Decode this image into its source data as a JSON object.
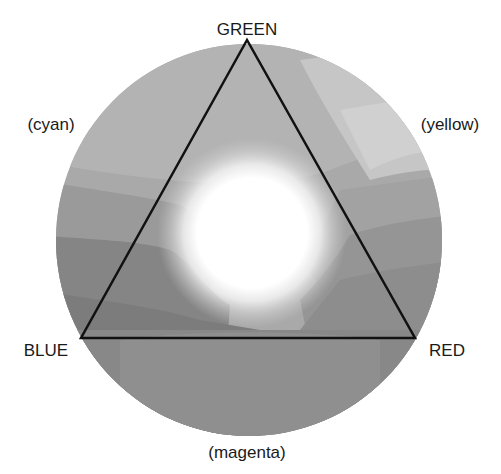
{
  "diagram": {
    "vertices": {
      "top": "GREEN",
      "left": "BLUE",
      "right": "RED"
    },
    "complements": {
      "upper_left": "(cyan)",
      "upper_right": "(yellow)",
      "bottom": "(magenta)"
    },
    "colors": {
      "background": "#ffffff",
      "triangle_stroke": "#111111",
      "center_glow": "#ffffff",
      "text": "#1a1a1a"
    }
  }
}
